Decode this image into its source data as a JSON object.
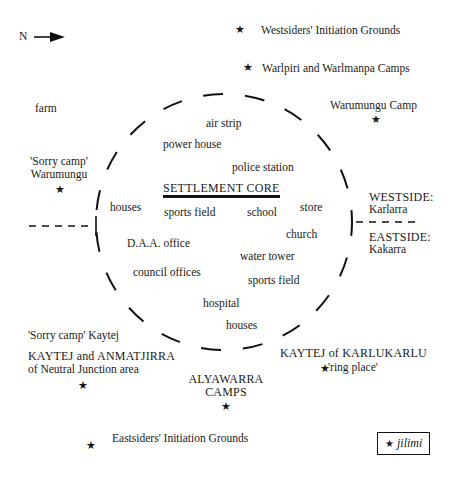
{
  "compass": {
    "label": "N",
    "direction": "east-arrow"
  },
  "outside_labels": {
    "westsiders_initiation": "Westsiders' Initiation Grounds",
    "warlpiri_camps": "Warlpiri and Warlmanpa Camps",
    "farm": "farm",
    "warumungu_camp": "Warumungu Camp",
    "sorry_camp_warumungu_1": "'Sorry camp'",
    "sorry_camp_warumungu_2": "Warumungu",
    "westside_1": "WESTSIDE:",
    "westside_2": "Karlarra",
    "eastside_1": "EASTSIDE:",
    "eastside_2": "Kakarra",
    "sorry_camp_kaytej": "'Sorry camp' Kaytej",
    "kaytej_anmatjirra_1": "KAYTEJ and ANMATJIRRA",
    "kaytej_anmatjirra_2": "of Neutral Junction area",
    "kaytej_karlukarlu_1": "KAYTEJ of KARLUKARLU",
    "kaytej_karlukarlu_2": "'ring place'",
    "alyawarra_1": "ALYAWARRA",
    "alyawarra_2": "CAMPS",
    "eastsiders_initiation": "Eastsiders' Initiation Grounds"
  },
  "settlement": {
    "title": "SETTLEMENT CORE",
    "facilities": {
      "air_strip": "air strip",
      "power_house": "power house",
      "police_station": "police station",
      "houses_west": "houses",
      "sports_field_1": "sports field",
      "school": "school",
      "store": "store",
      "daa_office": "D.A.A. office",
      "church": "church",
      "water_tower": "water tower",
      "council_offices": "council offices",
      "sports_field_2": "sports field",
      "hospital": "hospital",
      "houses_south": "houses"
    }
  },
  "legend": {
    "symbol": "★",
    "label": "jilimi"
  },
  "symbols": {
    "star": "★"
  }
}
